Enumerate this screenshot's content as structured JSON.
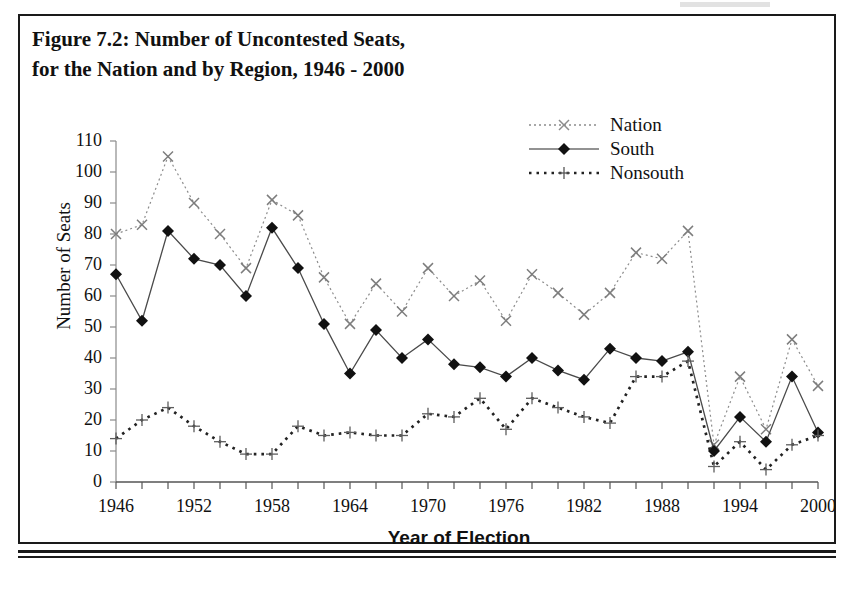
{
  "figure": {
    "title_line1": "Figure 7.2: Number of Uncontested Seats,",
    "title_line2": "for the Nation and by Region, 1946 - 2000"
  },
  "chart_data": {
    "type": "line",
    "title": "Figure 7.2: Number of Uncontested Seats, for the Nation and by Region, 1946 - 2000",
    "xlabel": "Year of Election",
    "ylabel": "Number of Seats",
    "xlim": [
      1946,
      2000
    ],
    "ylim": [
      0,
      110
    ],
    "ytick_step": 10,
    "yticks": [
      0,
      10,
      20,
      30,
      40,
      50,
      60,
      70,
      80,
      90,
      100,
      110
    ],
    "xticks_labeled": [
      1946,
      1952,
      1958,
      1964,
      1970,
      1976,
      1982,
      1988,
      1994,
      2000
    ],
    "x_minor_tick_step": 2,
    "grid": false,
    "legend_position": "top-right",
    "x": [
      1946,
      1948,
      1950,
      1952,
      1954,
      1956,
      1958,
      1960,
      1962,
      1964,
      1966,
      1968,
      1970,
      1972,
      1974,
      1976,
      1978,
      1980,
      1982,
      1984,
      1986,
      1988,
      1990,
      1992,
      1994,
      1996,
      1998,
      2000
    ],
    "series": [
      {
        "name": "Nation",
        "marker": "x",
        "line": "dotted",
        "color": "#7a7a7a",
        "values": [
          80,
          83,
          105,
          90,
          80,
          69,
          91,
          86,
          66,
          51,
          64,
          55,
          69,
          60,
          65,
          52,
          67,
          61,
          54,
          61,
          74,
          72,
          81,
          12,
          34,
          17,
          46,
          31
        ]
      },
      {
        "name": "South",
        "marker": "diamond",
        "line": "solid",
        "color": "#111111",
        "values": [
          67,
          52,
          81,
          72,
          70,
          60,
          82,
          69,
          51,
          35,
          49,
          40,
          46,
          38,
          37,
          34,
          40,
          36,
          33,
          43,
          40,
          39,
          42,
          10,
          21,
          13,
          34,
          16
        ]
      },
      {
        "name": "Nonsouth",
        "marker": "plus",
        "line": "dotted-thick",
        "color": "#333333",
        "values": [
          14,
          20,
          24,
          18,
          13,
          9,
          9,
          18,
          15,
          16,
          15,
          15,
          22,
          21,
          27,
          17,
          27,
          24,
          21,
          19,
          34,
          34,
          39,
          5,
          13,
          4,
          12,
          15
        ]
      }
    ]
  },
  "legend": {
    "items": [
      {
        "label": "Nation",
        "marker": "x-marker-icon"
      },
      {
        "label": "South",
        "marker": "diamond-marker-icon"
      },
      {
        "label": "Nonsouth",
        "marker": "plus-marker-icon"
      }
    ]
  }
}
